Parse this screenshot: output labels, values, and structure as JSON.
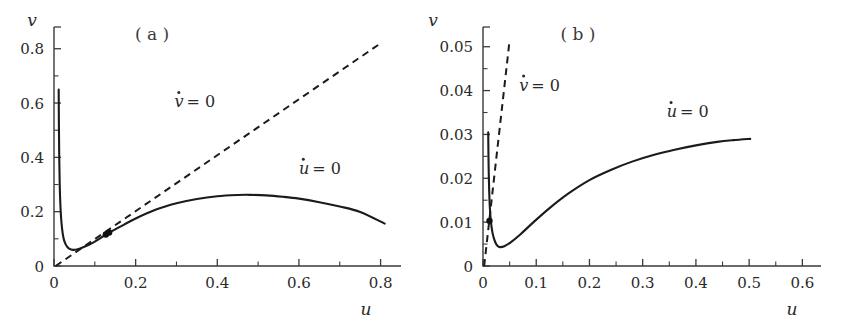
{
  "figure": {
    "background_color": "#ffffff",
    "ink_color": "#1b1b1b",
    "width": 843,
    "height": 324
  },
  "chart_data": [
    {
      "type": "line",
      "panel_label": "( a )",
      "title": "",
      "xlabel": "u",
      "ylabel": "v",
      "xlim": [
        0,
        0.85
      ],
      "ylim": [
        0,
        0.88
      ],
      "grid": false,
      "legend_position": "inline-annotations",
      "x_ticks_major": [
        0,
        0.2,
        0.4,
        0.6,
        0.8
      ],
      "x_ticks_major_labels": [
        "0",
        "0.2",
        "0.4",
        "0.6",
        "0.8"
      ],
      "x_ticks_minor": [
        0.1,
        0.3,
        0.5,
        0.7
      ],
      "y_ticks_major": [
        0,
        0.2,
        0.4,
        0.6,
        0.8
      ],
      "y_ticks_major_labels": [
        "0",
        "0.2",
        "0.4",
        "0.6",
        "0.8"
      ],
      "y_ticks_minor": [
        0.1,
        0.3,
        0.5,
        0.7
      ],
      "series": [
        {
          "name": "u-dot = 0",
          "label": "u̇ = 0",
          "style": "solid",
          "x": [
            0.0115,
            0.012,
            0.0128,
            0.014,
            0.0155,
            0.0175,
            0.02,
            0.023,
            0.027,
            0.032,
            0.038,
            0.046,
            0.056,
            0.07,
            0.088,
            0.11,
            0.13,
            0.16,
            0.2,
            0.25,
            0.3,
            0.35,
            0.4,
            0.45,
            0.48,
            0.52,
            0.56,
            0.6,
            0.65,
            0.7,
            0.75,
            0.81
          ],
          "y": [
            0.65,
            0.52,
            0.4,
            0.3,
            0.23,
            0.175,
            0.135,
            0.105,
            0.085,
            0.071,
            0.063,
            0.0595,
            0.061,
            0.068,
            0.08,
            0.099,
            0.118,
            0.143,
            0.175,
            0.208,
            0.231,
            0.247,
            0.257,
            0.2615,
            0.262,
            0.26,
            0.255,
            0.248,
            0.235,
            0.219,
            0.199,
            0.156
          ]
        },
        {
          "name": "v-dot = 0",
          "label": "v̇ = 0",
          "style": "dashed",
          "x": [
            0.004,
            0.8
          ],
          "y": [
            0.0,
            0.82
          ]
        }
      ],
      "fixed_points": [
        {
          "x": 0.127,
          "y": 0.116
        },
        {
          "x": 0.135,
          "y": 0.123
        }
      ],
      "annotations": [
        {
          "text": "v̇ = 0",
          "x": 0.295,
          "y": 0.585
        },
        {
          "text": "u̇ = 0",
          "x": 0.6,
          "y": 0.34
        }
      ]
    },
    {
      "type": "line",
      "panel_label": "( b )",
      "title": "",
      "xlabel": "u",
      "ylabel": "v",
      "xlim": [
        0,
        0.635
      ],
      "ylim": [
        0,
        0.0545
      ],
      "grid": false,
      "legend_position": "inline-annotations",
      "x_ticks_major": [
        0,
        0.1,
        0.2,
        0.3,
        0.4,
        0.5,
        0.6
      ],
      "x_ticks_major_labels": [
        "0",
        "0.1",
        "0.2",
        "0.3",
        "0.4",
        "0.5",
        "0.6"
      ],
      "x_ticks_minor": [
        0.05,
        0.15,
        0.25,
        0.35,
        0.45,
        0.55
      ],
      "y_ticks_major": [
        0,
        0.01,
        0.02,
        0.03,
        0.04,
        0.05
      ],
      "y_ticks_major_labels": [
        "0",
        "0.01",
        "0.02",
        "0.03",
        "0.04",
        "0.05"
      ],
      "y_ticks_minor": [
        0.005,
        0.015,
        0.025,
        0.035,
        0.045
      ],
      "series": [
        {
          "name": "u-dot = 0",
          "label": "u̇ = 0",
          "style": "solid",
          "x": [
            0.0098,
            0.01,
            0.0104,
            0.011,
            0.0118,
            0.0128,
            0.0142,
            0.016,
            0.018,
            0.0205,
            0.0235,
            0.027,
            0.032,
            0.04,
            0.052,
            0.07,
            0.095,
            0.125,
            0.16,
            0.2,
            0.24,
            0.28,
            0.32,
            0.36,
            0.4,
            0.44,
            0.47,
            0.502
          ],
          "y": [
            0.0305,
            0.028,
            0.024,
            0.02,
            0.0165,
            0.0135,
            0.011,
            0.009,
            0.0075,
            0.0063,
            0.0053,
            0.0046,
            0.0043,
            0.0045,
            0.0054,
            0.0072,
            0.01,
            0.0132,
            0.0165,
            0.0196,
            0.0219,
            0.0238,
            0.0253,
            0.0265,
            0.0275,
            0.0283,
            0.0287,
            0.029
          ]
        },
        {
          "name": "v-dot = 0",
          "label": "v̇ = 0",
          "style": "dashed",
          "x": [
            0.0022,
            0.05
          ],
          "y": [
            0.0,
            0.0515
          ]
        }
      ],
      "fixed_points": [
        {
          "x": 0.0122,
          "y": 0.0103
        }
      ],
      "annotations": [
        {
          "text": "v̇ = 0",
          "x": 0.068,
          "y": 0.04
        },
        {
          "text": "u̇ = 0",
          "x": 0.345,
          "y": 0.034
        }
      ]
    }
  ]
}
